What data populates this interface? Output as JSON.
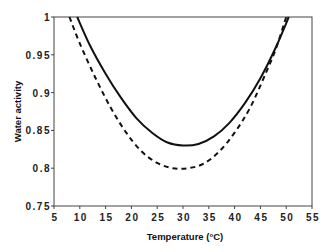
{
  "chart_data": {
    "type": "line",
    "title": "",
    "xlabel": "Temperature (°C)",
    "ylabel": "Water activity",
    "xlim": [
      5,
      55
    ],
    "ylim": [
      0.75,
      1
    ],
    "xticks": [
      "5",
      "10",
      "15",
      "20",
      "25",
      "30",
      "35",
      "40",
      "45",
      "50",
      "55"
    ],
    "yticks": [
      "0.75",
      "0.8",
      "0.85",
      "0.9",
      "0.95",
      "1"
    ],
    "grid": false,
    "legend": null,
    "series": [
      {
        "name": "solid",
        "style": "solid",
        "x": [
          9.5,
          12,
          15,
          18,
          21,
          24,
          27,
          30,
          33,
          36,
          39,
          42,
          45,
          48,
          50.5
        ],
        "y": [
          1.0,
          0.962,
          0.925,
          0.893,
          0.866,
          0.847,
          0.834,
          0.83,
          0.832,
          0.842,
          0.86,
          0.886,
          0.919,
          0.96,
          1.0
        ]
      },
      {
        "name": "dashed",
        "style": "dashed",
        "x": [
          8,
          10,
          13,
          16,
          19,
          22,
          25,
          28,
          31,
          34,
          37,
          40,
          43,
          46,
          48,
          50
        ],
        "y": [
          1.0,
          0.965,
          0.92,
          0.88,
          0.847,
          0.822,
          0.807,
          0.8,
          0.8,
          0.806,
          0.822,
          0.847,
          0.88,
          0.925,
          0.958,
          1.0
        ]
      }
    ]
  }
}
